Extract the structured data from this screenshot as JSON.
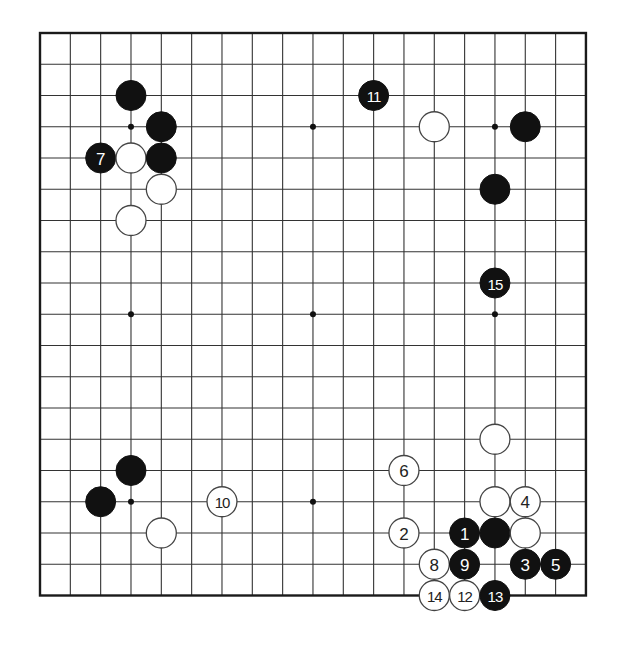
{
  "board": {
    "size": 19,
    "origin": {
      "x": 40,
      "y": 33
    },
    "spacing": {
      "x": 30.33,
      "y": 31.25
    },
    "stone_radius": 15,
    "colors": {
      "line": "#333333",
      "border": "#1a1a1a",
      "black_stone": "#111111",
      "white_stone": "#ffffff",
      "white_stroke": "#444444",
      "black_label": "#ffffff",
      "white_label": "#222222"
    },
    "star_points": [
      [
        3,
        3
      ],
      [
        9,
        3
      ],
      [
        15,
        3
      ],
      [
        3,
        9
      ],
      [
        9,
        9
      ],
      [
        15,
        9
      ],
      [
        3,
        15
      ],
      [
        9,
        15
      ],
      [
        15,
        15
      ]
    ]
  },
  "stones": [
    {
      "color": "black",
      "col": 3,
      "row": 2,
      "label": ""
    },
    {
      "color": "black",
      "col": 4,
      "row": 3,
      "label": ""
    },
    {
      "color": "black",
      "col": 2,
      "row": 4,
      "label": "7"
    },
    {
      "color": "white",
      "col": 3,
      "row": 4,
      "label": ""
    },
    {
      "color": "black",
      "col": 4,
      "row": 4,
      "label": ""
    },
    {
      "color": "white",
      "col": 4,
      "row": 5,
      "label": ""
    },
    {
      "color": "white",
      "col": 3,
      "row": 6,
      "label": ""
    },
    {
      "color": "black",
      "col": 11,
      "row": 2,
      "label": "11"
    },
    {
      "color": "white",
      "col": 13,
      "row": 3,
      "label": ""
    },
    {
      "color": "black",
      "col": 16,
      "row": 3,
      "label": ""
    },
    {
      "color": "black",
      "col": 15,
      "row": 5,
      "label": ""
    },
    {
      "color": "black",
      "col": 15,
      "row": 8,
      "label": "15"
    },
    {
      "color": "black",
      "col": 3,
      "row": 14,
      "label": ""
    },
    {
      "color": "black",
      "col": 2,
      "row": 15,
      "label": ""
    },
    {
      "color": "white",
      "col": 6,
      "row": 15,
      "label": "10"
    },
    {
      "color": "white",
      "col": 4,
      "row": 16,
      "label": ""
    },
    {
      "color": "white",
      "col": 15,
      "row": 13,
      "label": ""
    },
    {
      "color": "white",
      "col": 12,
      "row": 14,
      "label": "6"
    },
    {
      "color": "white",
      "col": 15,
      "row": 15,
      "label": ""
    },
    {
      "color": "white",
      "col": 16,
      "row": 15,
      "label": "4"
    },
    {
      "color": "white",
      "col": 12,
      "row": 16,
      "label": "2"
    },
    {
      "color": "black",
      "col": 14,
      "row": 16,
      "label": "1"
    },
    {
      "color": "black",
      "col": 15,
      "row": 16,
      "label": ""
    },
    {
      "color": "white",
      "col": 16,
      "row": 16,
      "label": ""
    },
    {
      "color": "white",
      "col": 13,
      "row": 17,
      "label": "8"
    },
    {
      "color": "black",
      "col": 14,
      "row": 17,
      "label": "9"
    },
    {
      "color": "black",
      "col": 16,
      "row": 17,
      "label": "3"
    },
    {
      "color": "black",
      "col": 17,
      "row": 17,
      "label": "5"
    },
    {
      "color": "white",
      "col": 13,
      "row": 18,
      "label": "14"
    },
    {
      "color": "white",
      "col": 14,
      "row": 18,
      "label": "12"
    },
    {
      "color": "black",
      "col": 15,
      "row": 18,
      "label": "13"
    }
  ]
}
